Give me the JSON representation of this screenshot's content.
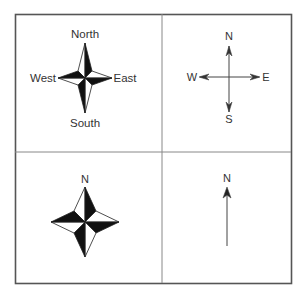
{
  "figure": {
    "frame": {
      "x": 15,
      "y": 14,
      "width": 276,
      "height": 269,
      "stroke": "#555555"
    },
    "dividers": {
      "vertical_x": 162,
      "horizontal_y": 152,
      "stroke": "#777777"
    },
    "panels": [
      {
        "id": "compass-rose-full-labels",
        "type": "compass-rose",
        "labels": {
          "north": "North",
          "south": "South",
          "west": "West",
          "east": "East"
        }
      },
      {
        "id": "cross-arrows",
        "type": "cross-arrows",
        "labels": {
          "north": "N",
          "south": "S",
          "west": "W",
          "east": "E"
        }
      },
      {
        "id": "compass-rose-north-only",
        "type": "compass-rose",
        "labels": {
          "north": "N"
        }
      },
      {
        "id": "north-arrow",
        "type": "single-arrow",
        "labels": {
          "north": "N"
        }
      }
    ],
    "colors": {
      "fill_dark": "#111111",
      "fill_light": "#ffffff",
      "line": "#333333",
      "text": "#333333"
    }
  }
}
